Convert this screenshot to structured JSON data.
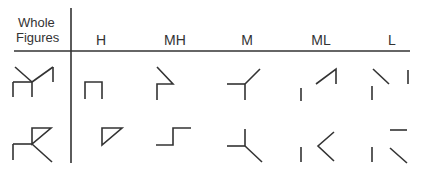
{
  "header": {
    "row_label_line1": "Whole",
    "row_label_line2": "Figures",
    "columns": [
      {
        "label": "H",
        "x": 101
      },
      {
        "label": "MH",
        "x": 175
      },
      {
        "label": "M",
        "x": 247
      },
      {
        "label": "ML",
        "x": 321
      },
      {
        "label": "L",
        "x": 392
      }
    ]
  },
  "rows": [
    {
      "name": "figure-row-1",
      "whole": "branching figure with pi base, diagonal peak and right vertical",
      "parts": [
        "H: inverted-U (pi) shape",
        "MH: diagonal into corner with vertical",
        "M: Y-junction with horizontal, vertical and diagonal",
        "ML: short vertical plus diagonal with vertical",
        "L: diagonal, short vertical, separate vertical"
      ]
    },
    {
      "name": "figure-row-2",
      "whole": "figure with triangle top, left step and diagonal tail",
      "parts": [
        "H: right triangle",
        "MH: step shape",
        "M: inverted-T with diagonal tail",
        "ML: short vertical plus angle bracket",
        "L: horizontal dash, short vertical, diagonal"
      ]
    }
  ],
  "colors": {
    "ink": "#333333",
    "background": "#ffffff"
  }
}
